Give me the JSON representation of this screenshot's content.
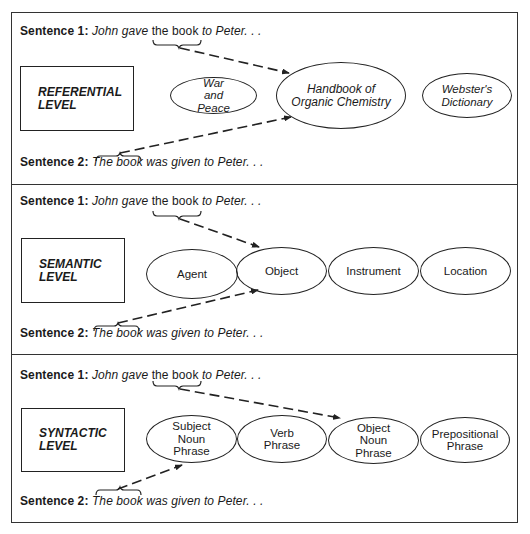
{
  "panels": [
    {
      "level_label_line1": "REFERENTIAL",
      "level_label_line2": "LEVEL",
      "sentence1": {
        "label": "Sentence 1",
        "colon": ":",
        "pre": "John gave",
        "mid": "the book",
        "post": "to Peter. . ."
      },
      "sentence2": {
        "label": "Sentence 2",
        "colon": ":",
        "mid": "The book",
        "post": "was given to Peter. . ."
      },
      "nodes": [
        {
          "lines": [
            "War",
            "and",
            "Peace"
          ]
        },
        {
          "lines": [
            "Handbook of",
            "Organic Chemistry"
          ]
        },
        {
          "lines": [
            "Webster's",
            "Dictionary"
          ]
        }
      ],
      "target_node": "Handbook of Organic Chemistry"
    },
    {
      "level_label_line1": "SEMANTIC",
      "level_label_line2": "LEVEL",
      "sentence1": {
        "label": "Sentence 1",
        "colon": ":",
        "pre": "John gave",
        "mid": "the book",
        "post": "to Peter. . ."
      },
      "sentence2": {
        "label": "Sentence 2",
        "colon": ":",
        "mid": "The book",
        "post": "was given to Peter. . ."
      },
      "nodes": [
        {
          "lines": [
            "Agent"
          ]
        },
        {
          "lines": [
            "Object"
          ]
        },
        {
          "lines": [
            "Instrument"
          ]
        },
        {
          "lines": [
            "Location"
          ]
        }
      ],
      "target_node": "Object"
    },
    {
      "level_label_line1": "SYNTACTIC",
      "level_label_line2": "LEVEL",
      "sentence1": {
        "label": "Sentence 1",
        "colon": ":",
        "pre": "John gave",
        "mid": "the book",
        "post": "to Peter. . ."
      },
      "sentence2": {
        "label": "Sentence 2",
        "colon": ":",
        "mid": "The book",
        "post": "was given to Peter. . ."
      },
      "nodes": [
        {
          "lines": [
            "Subject",
            "Noun",
            "Phrase"
          ]
        },
        {
          "lines": [
            "Verb",
            "Phrase"
          ]
        },
        {
          "lines": [
            "Object",
            "Noun",
            "Phrase"
          ]
        },
        {
          "lines": [
            "Prepositional",
            "Phrase"
          ]
        }
      ],
      "target_node_sentence1": "Object Noun Phrase",
      "target_node_sentence2": "Subject Noun Phrase"
    }
  ],
  "colors": {
    "line": "#222222",
    "background": "#ffffff"
  }
}
